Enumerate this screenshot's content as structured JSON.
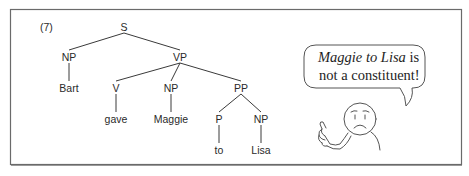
{
  "figure": {
    "example_number": "(7)",
    "frame_color": "#555555",
    "line_color": "#3a3a3a"
  },
  "tree": {
    "nodes": [
      {
        "id": "S",
        "label": "S",
        "x": 124,
        "y": 27
      },
      {
        "id": "NP1",
        "label": "NP",
        "x": 69,
        "y": 57
      },
      {
        "id": "VP",
        "label": "VP",
        "x": 180,
        "y": 57
      },
      {
        "id": "Bart",
        "label": "Bart",
        "x": 69,
        "y": 88
      },
      {
        "id": "V",
        "label": "V",
        "x": 116,
        "y": 88
      },
      {
        "id": "NP2",
        "label": "NP",
        "x": 171,
        "y": 88
      },
      {
        "id": "PP",
        "label": "PP",
        "x": 241,
        "y": 88
      },
      {
        "id": "gave",
        "label": "gave",
        "x": 116,
        "y": 119
      },
      {
        "id": "Maggie",
        "label": "Maggie",
        "x": 171,
        "y": 119
      },
      {
        "id": "P",
        "label": "P",
        "x": 219,
        "y": 119
      },
      {
        "id": "NP3",
        "label": "NP",
        "x": 261,
        "y": 119
      },
      {
        "id": "to",
        "label": "to",
        "x": 219,
        "y": 150
      },
      {
        "id": "Lisa",
        "label": "Lisa",
        "x": 261,
        "y": 150
      }
    ],
    "edges": [
      [
        "S",
        "NP1"
      ],
      [
        "S",
        "VP"
      ],
      [
        "NP1",
        "Bart"
      ],
      [
        "VP",
        "V"
      ],
      [
        "VP",
        "NP2"
      ],
      [
        "VP",
        "PP"
      ],
      [
        "V",
        "gave"
      ],
      [
        "NP2",
        "Maggie"
      ],
      [
        "PP",
        "P"
      ],
      [
        "PP",
        "NP3"
      ],
      [
        "P",
        "to"
      ],
      [
        "NP3",
        "Lisa"
      ]
    ]
  },
  "speech_bubble": {
    "line1_italic": "Maggie to Lisa",
    "line1_rest": " is",
    "line2": "not a constituent!"
  },
  "character": {
    "expression": "sad",
    "gesture": "pointing"
  }
}
